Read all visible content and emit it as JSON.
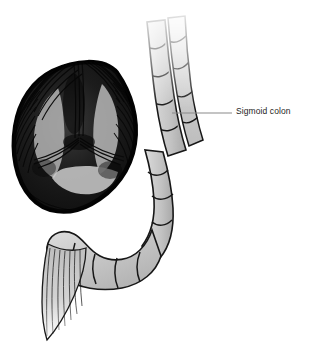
{
  "figure": {
    "background_color": "#ffffff",
    "annotations": [
      {
        "id": "sigmoid-colon",
        "label": "Sigmoid colon",
        "text_color": "#1d1d1d",
        "text_x": 236,
        "text_y": 107,
        "leader_color": "#8a8a8a",
        "leader_from_x": 172,
        "leader_from_y": 113,
        "leader_to_x": 232,
        "leader_to_y": 113
      }
    ],
    "structures": [
      {
        "name": "rectum-cross-section",
        "description": "Cross-sectional view of the rectum with three-lobed mucosal folds rendered in dense radial engraving hatching",
        "fill_dark": "#0a0a0a",
        "fill_mid": "#6e6e6e",
        "fill_light": "#d9d9d9"
      },
      {
        "name": "sigmoid-colon-upper-limb",
        "description": "Ascending limb of the sigmoid colon with haustral segmentation",
        "fill": "#c9c9c9",
        "outline": "#141414"
      },
      {
        "name": "sigmoid-colon-descending-limb",
        "description": "Descending limb of the sigmoid colon with haustral segmentation",
        "fill": "#c9c9c9",
        "outline": "#141414"
      },
      {
        "name": "sigmoid-colon-lower-loop",
        "description": "S-shaped lower loop of the sigmoid colon with haustral pouches",
        "fill": "#c9c9c9",
        "outline": "#141414"
      },
      {
        "name": "colon-tapered-tail",
        "description": "Tapering cut end of bowel rendered with fine vertical line hatching",
        "fill": "#b4b4b4",
        "outline": "#1a1a1a"
      }
    ],
    "palette": {
      "outline": "#141414",
      "tissue_light": "#d6d6d6",
      "tissue_mid": "#c0c0c0",
      "tissue_dark": "#6a6a6a",
      "shadow": "#0a0a0a",
      "leader_line": "#8a8a8a",
      "text": "#1d1d1d",
      "background": "#ffffff"
    }
  }
}
